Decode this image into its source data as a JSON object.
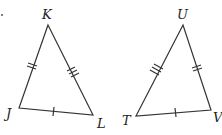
{
  "diagram": {
    "triangles": [
      {
        "name": "JKL",
        "vertices": [
          {
            "label": "K",
            "x": 48,
            "y": 25,
            "lx": 42,
            "ly": 19
          },
          {
            "label": "J",
            "x": 19,
            "y": 108,
            "lx": 6,
            "ly": 118
          },
          {
            "label": "L",
            "x": 93,
            "y": 115,
            "lx": 97,
            "ly": 128
          }
        ],
        "tick_marks": {
          "JK": 2,
          "KL": 3,
          "JL": 1
        }
      },
      {
        "name": "TUV",
        "vertices": [
          {
            "label": "U",
            "x": 183,
            "y": 25,
            "lx": 177,
            "ly": 19
          },
          {
            "label": "T",
            "x": 136,
            "y": 116,
            "lx": 122,
            "ly": 125
          },
          {
            "label": "V",
            "x": 211,
            "y": 110,
            "lx": 213,
            "ly": 122
          }
        ],
        "tick_marks": {
          "TU": 3,
          "UV": 2,
          "TV": 1
        }
      }
    ],
    "stroke_color": "#333333"
  }
}
